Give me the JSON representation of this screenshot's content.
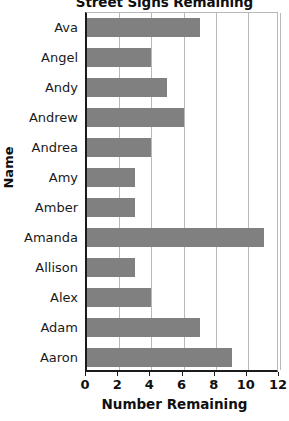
{
  "chart_data": {
    "type": "bar",
    "orientation": "horizontal",
    "title": "Street Signs Remaining",
    "xlabel": "Number Remaining",
    "ylabel": "Name",
    "categories": [
      "Ava",
      "Angel",
      "Andy",
      "Andrew",
      "Andrea",
      "Amy",
      "Amber",
      "Amanda",
      "Allison",
      "Alex",
      "Adam",
      "Aaron"
    ],
    "values": [
      7,
      4,
      5,
      6,
      4,
      3,
      3,
      11,
      3,
      4,
      7,
      9
    ],
    "xlim": [
      0,
      12
    ],
    "xticks": [
      0,
      2,
      4,
      6,
      8,
      10,
      12
    ],
    "xtick_labels": [
      "0",
      "2",
      "4",
      "6",
      "8",
      "10",
      "12"
    ],
    "grid": "vertical",
    "legend": "none",
    "bar_color": "#808080",
    "axis_color": "#1a1a1a",
    "gridline_color": "#b9b9b9",
    "background_color": "#ffffff"
  }
}
